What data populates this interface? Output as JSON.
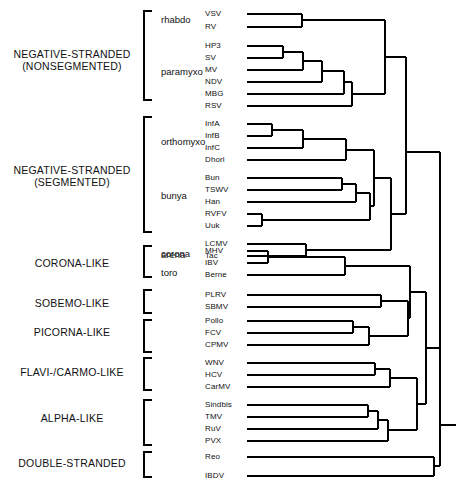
{
  "figure": {
    "type": "phylogenetic-tree",
    "orientation": "left-to-right-cladogram",
    "taxa_count": 31
  },
  "groups": [
    {
      "id": "neg-nonseg",
      "line1": "NEGATIVE-STRANDED",
      "line2": "(NONSEGMENTED)"
    },
    {
      "id": "neg-seg",
      "line1": "NEGATIVE-STRANDED",
      "line2": "(SEGMENTED)"
    },
    {
      "id": "corona",
      "line1": "CORONA-LIKE",
      "line2": ""
    },
    {
      "id": "sobemo",
      "line1": "SOBEMO-LIKE",
      "line2": ""
    },
    {
      "id": "picorna",
      "line1": "PICORNA-LIKE",
      "line2": ""
    },
    {
      "id": "flavi",
      "line1": "FLAVI-/CARMO-LIKE",
      "line2": ""
    },
    {
      "id": "alpha",
      "line1": "ALPHA-LIKE",
      "line2": ""
    },
    {
      "id": "ds",
      "line1": "DOUBLE-STRANDED",
      "line2": ""
    }
  ],
  "families": [
    {
      "id": "rhabdo",
      "label": "rhabdo"
    },
    {
      "id": "paramyxo",
      "label": "paramyxo"
    },
    {
      "id": "orthomyxo",
      "label": "orthomyxo"
    },
    {
      "id": "bunya",
      "label": "bunya"
    },
    {
      "id": "arena",
      "label": "arena"
    },
    {
      "id": "corona",
      "label": "corona"
    },
    {
      "id": "toro",
      "label": "toro"
    }
  ],
  "taxa": [
    {
      "id": "VSV",
      "label": "VSV"
    },
    {
      "id": "RV",
      "label": "RV"
    },
    {
      "id": "HP3",
      "label": "HP3"
    },
    {
      "id": "SV",
      "label": "SV"
    },
    {
      "id": "MV",
      "label": "MV"
    },
    {
      "id": "NDV",
      "label": "NDV"
    },
    {
      "id": "MBG",
      "label": "MBG"
    },
    {
      "id": "RSV",
      "label": "RSV"
    },
    {
      "id": "InfA",
      "label": "InfA"
    },
    {
      "id": "InfB",
      "label": "InfB"
    },
    {
      "id": "InfC",
      "label": "InfC"
    },
    {
      "id": "Dhorl",
      "label": "Dhorl"
    },
    {
      "id": "Bun",
      "label": "Bun"
    },
    {
      "id": "TSWV",
      "label": "TSWV"
    },
    {
      "id": "Han",
      "label": "Han"
    },
    {
      "id": "RVFV",
      "label": "RVFV"
    },
    {
      "id": "Uuk",
      "label": "Uuk"
    },
    {
      "id": "LCMV",
      "label": "LCMV"
    },
    {
      "id": "Tac",
      "label": "Tac"
    },
    {
      "id": "MHV",
      "label": "MHV"
    },
    {
      "id": "IBV",
      "label": "IBV"
    },
    {
      "id": "Berne",
      "label": "Berne"
    },
    {
      "id": "PLRV",
      "label": "PLRV"
    },
    {
      "id": "SBMV",
      "label": "SBMV"
    },
    {
      "id": "Pollo",
      "label": "Pollo"
    },
    {
      "id": "FCV",
      "label": "FCV"
    },
    {
      "id": "CPMV",
      "label": "CPMV"
    },
    {
      "id": "WNV",
      "label": "WNV"
    },
    {
      "id": "HCV",
      "label": "HCV"
    },
    {
      "id": "CarMV",
      "label": "CarMV"
    },
    {
      "id": "Sindbis",
      "label": "Sindbis"
    },
    {
      "id": "TMV",
      "label": "TMV"
    },
    {
      "id": "RuV",
      "label": "RuV"
    },
    {
      "id": "PVX",
      "label": "PVX"
    },
    {
      "id": "Reo",
      "label": "Reo"
    },
    {
      "id": "IBDV",
      "label": "IBDV"
    }
  ],
  "colors": {
    "ink": "#000000",
    "background": "#ffffff"
  }
}
